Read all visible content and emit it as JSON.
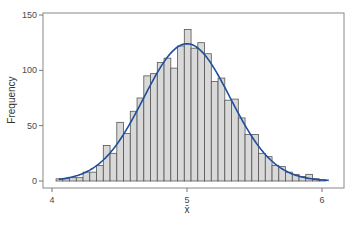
{
  "chart_data": {
    "type": "bar",
    "subtype": "histogram",
    "title": "",
    "xlabel": "x̄",
    "ylabel": "Frequency",
    "xlim": [
      3.97,
      6.2
    ],
    "ylim": [
      -4,
      155
    ],
    "x_ticks": [
      4,
      5,
      6
    ],
    "y_ticks": [
      0,
      50,
      100,
      150
    ],
    "grid": false,
    "legend": null,
    "bin_width": 0.05,
    "bins_left_edges": [
      4.03,
      4.08,
      4.13,
      4.18,
      4.23,
      4.28,
      4.33,
      4.38,
      4.43,
      4.48,
      4.53,
      4.58,
      4.63,
      4.68,
      4.73,
      4.78,
      4.83,
      4.88,
      4.93,
      4.98,
      5.03,
      5.08,
      5.13,
      5.18,
      5.23,
      5.28,
      5.33,
      5.38,
      5.43,
      5.48,
      5.53,
      5.58,
      5.63,
      5.68,
      5.73,
      5.78,
      5.83,
      5.88,
      5.93,
      5.98
    ],
    "values": [
      2,
      2,
      3,
      3,
      8,
      8,
      14,
      32,
      25,
      53,
      43,
      63,
      75,
      95,
      97,
      107,
      111,
      102,
      122,
      137,
      120,
      125,
      115,
      90,
      93,
      73,
      74,
      57,
      42,
      42,
      25,
      22,
      14,
      13,
      8,
      6,
      4,
      6,
      2,
      1
    ],
    "overlay_curve": {
      "type": "normal_density",
      "mean": 5.0,
      "sd": 0.32,
      "peak": 124,
      "x_range": [
        4.05,
        6.05
      ],
      "color": "#1f4e9c"
    },
    "colors": {
      "bar_fill": "#d9d9d9",
      "bar_edge": "#555555",
      "axis": "#777777",
      "curve": "#1f4e9c"
    }
  }
}
